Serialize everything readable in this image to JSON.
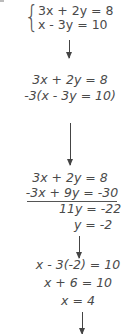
{
  "system": {
    "eq1": "3x + 2y = 8",
    "eq2": "x - 3y = 10"
  },
  "step1": {
    "line1": "3x + 2y = 8",
    "line2": "-3(x - 3y = 10)"
  },
  "step2": {
    "line1": "3x + 2y = 8",
    "line2": "-3x + 9y = -30",
    "sum": "11y = -22",
    "result": "y = -2"
  },
  "step3": {
    "line1": "x - 3(-2) = 10",
    "line2": "x + 6 = 10",
    "result": "x = 4"
  },
  "colors": {
    "text": "#4a4a4a",
    "arrow": "#444444",
    "background": "#ffffff"
  }
}
